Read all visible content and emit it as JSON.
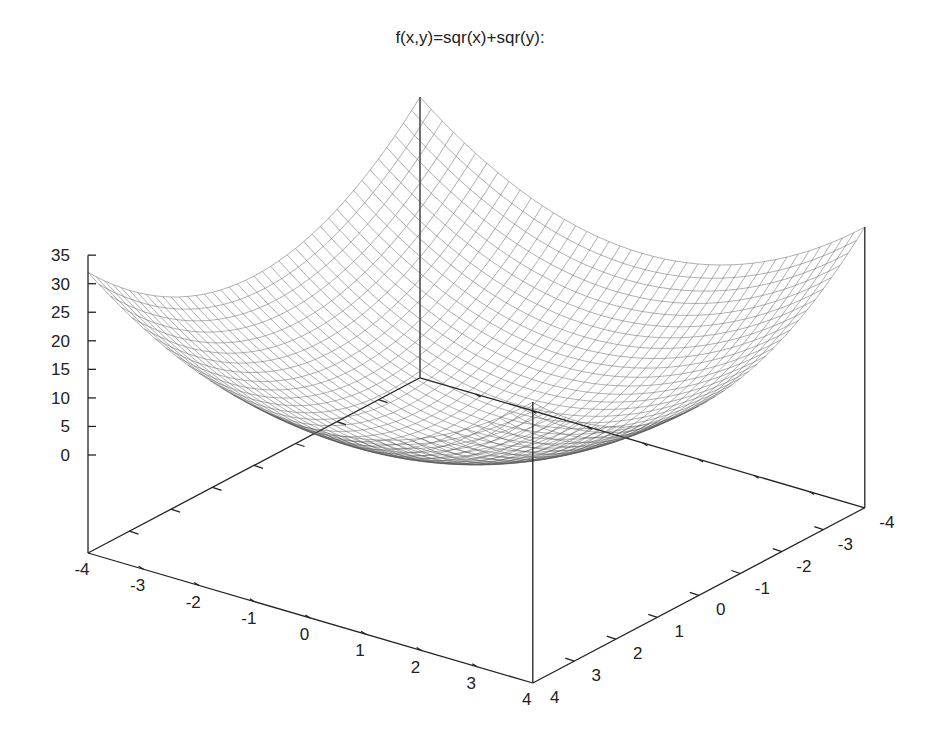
{
  "chart_data": {
    "type": "surface",
    "title": "f(x,y)=sqr(x)+sqr(y):",
    "function": "x^2 + y^2",
    "x_range": [
      -4,
      4
    ],
    "y_range": [
      -4,
      4
    ],
    "z_range": [
      0,
      35
    ],
    "x_ticks": [
      "-4",
      "-3",
      "-2",
      "-1",
      "0",
      "1",
      "2",
      "3",
      "4"
    ],
    "y_ticks": [
      "-4",
      "-3",
      "-2",
      "-1",
      "0",
      "1",
      "2",
      "3",
      "4"
    ],
    "z_ticks": [
      "0",
      "5",
      "10",
      "15",
      "20",
      "25",
      "30",
      "35"
    ],
    "grid_samples": 41,
    "style": "wireframe (hidden-line off)",
    "corner_values": {
      "f(-4,-4)": 32,
      "f(-4,4)": 32,
      "f(4,-4)": 32,
      "f(4,4)": 32,
      "f(0,0)": 0
    },
    "xlabel": "",
    "ylabel": "",
    "zlabel": "",
    "colors": {
      "surface": "#555555",
      "axes": "#222222",
      "background": "#ffffff"
    }
  },
  "projection": {
    "origin_x_minus4_y_plus4": [
      88,
      553
    ],
    "x_unit": [
      55.6,
      16.25
    ],
    "y_unit": [
      41.5,
      -21.9
    ],
    "z_unit": -5.71,
    "z_offset": -98
  }
}
